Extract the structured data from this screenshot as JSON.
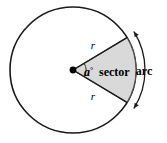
{
  "figure": {
    "width": 167,
    "height": 143,
    "background_color": "#ffffff"
  },
  "colors": {
    "stroke": "#1a1a1a",
    "sector_fill": "#d9d9d9",
    "sector_stroke": "#555555",
    "center_dot": "#000000",
    "text": "#000000",
    "background": "#ffffff"
  },
  "circle": {
    "center_x": 73,
    "center_y": 70,
    "radius": 63,
    "stroke_width": 1.6,
    "fill": "#ffffff"
  },
  "sector": {
    "start_angle_deg": -31,
    "end_angle_deg": 31,
    "fill": "#d9d9d9",
    "label": "sector"
  },
  "center_point": {
    "radius": 3.4,
    "color": "#000000"
  },
  "angle_marker": {
    "arc_radius": 13,
    "stroke_width": 1.0
  },
  "labels": {
    "radius_upper": {
      "text": "r",
      "x": 93,
      "y": 49
    },
    "radius_lower": {
      "text": "r",
      "x": 93,
      "y": 100
    },
    "angle_variable": "a",
    "angle_degree_symbol": "°",
    "angle_label_x": 84,
    "angle_label_y": 76,
    "sector_text": "sector",
    "sector_label_x": 99,
    "sector_label_y": 76,
    "arc_text": "arc",
    "arc_label_x": 144,
    "arc_label_y": 75
  },
  "arc_arrow": {
    "offset_from_circle": 9,
    "start_angle_deg": -32,
    "end_angle_deg": 32,
    "stroke_width": 1.3,
    "arrowhead_size": 5,
    "double_headed": true
  }
}
